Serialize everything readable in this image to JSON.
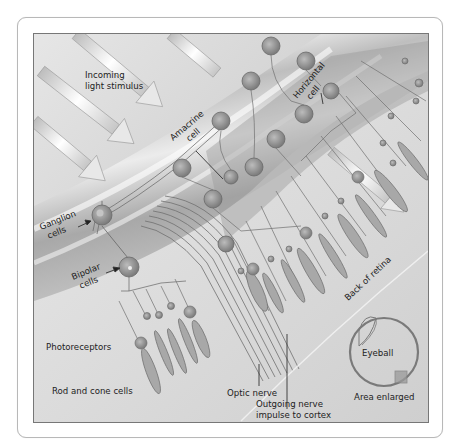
{
  "figure": {
    "colors": {
      "background": "#ffffff",
      "frame_border": "#b8b8b8",
      "panel_border": "#777777",
      "vitreous": "#d4d4d4",
      "band_light": "#f2f2f2",
      "band_dark": "#a9a9a9",
      "cell_body": "#8d8d8d",
      "cell_nucleus": "#c8c8c8",
      "fiber": "#6e6e6e",
      "text": "#222222"
    }
  },
  "labels": {
    "incoming_light": [
      "Incoming",
      "light stimulus"
    ],
    "amacrine": [
      "Amacrine",
      "cell"
    ],
    "horizontal": [
      "Horizontal",
      "cell"
    ],
    "ganglion": [
      "Ganglion",
      "cells"
    ],
    "bipolar": [
      "Bipolar",
      "cells"
    ],
    "photoreceptors": "Photoreceptors",
    "rod_cone": "Rod and cone cells",
    "back_of_retina": "Back of retina",
    "optic_nerve": "Optic nerve",
    "outgoing": [
      "Outgoing nerve",
      "impulse to cortex"
    ],
    "eyeball": "Eyeball",
    "area_enlarged": "Area enlarged"
  }
}
